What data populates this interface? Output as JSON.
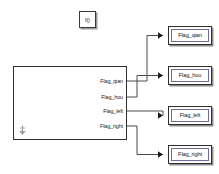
{
  "canvas": {
    "width": 219,
    "height": 174,
    "background": "#ffffff",
    "line_color": "#4a4a4a",
    "border_color": "#2e2e2e",
    "shadow_color": "#8f8f8f",
    "text_color": "#1c1c1c"
  },
  "trigger_block": {
    "label": "f()",
    "name": "function-call-trigger",
    "x": 79,
    "y": 11,
    "width": 17,
    "height": 17
  },
  "main_block": {
    "name": "subsystem-block",
    "x": 13,
    "y": 66,
    "width": 114,
    "height": 74,
    "anchor_icon": "anchor-arrow-icon",
    "ports": [
      {
        "label": "Flag_qian",
        "y": 81
      },
      {
        "label": "Flag_hou",
        "y": 97
      },
      {
        "label": "Flag_left",
        "y": 111
      },
      {
        "label": "Flag_right",
        "y": 126
      }
    ]
  },
  "destination_blocks": [
    {
      "label": "Flag_qian",
      "x": 168,
      "y": 26,
      "width": 44,
      "height": 19
    },
    {
      "label": "Flag_hou",
      "x": 168,
      "y": 66,
      "width": 44,
      "height": 19
    },
    {
      "label": "Flag_left",
      "x": 168,
      "y": 106,
      "width": 44,
      "height": 19
    },
    {
      "label": "Flag_right",
      "x": 168,
      "y": 145,
      "width": 44,
      "height": 19
    }
  ],
  "wires": [
    {
      "name": "wire-flag-qian",
      "path": "M127,81 L147,81 L147,35.5 L163,35.5"
    },
    {
      "name": "wire-flag-hou",
      "path": "M127,97 L137,97 L137,75.5 L163,75.5"
    },
    {
      "name": "wire-flag-left",
      "path": "M127,111 L163,111 L163,115.5"
    },
    {
      "name": "wire-flag-right",
      "path": "M127,126 L137,126 L137,154.5 L163,154.5"
    }
  ],
  "arrowheads": [
    {
      "name": "arrowhead-flag-qian",
      "x": 163,
      "y": 35.5
    },
    {
      "name": "arrowhead-flag-hou",
      "x": 163,
      "y": 75.5
    },
    {
      "name": "arrowhead-flag-left",
      "x": 163,
      "y": 115.5
    },
    {
      "name": "arrowhead-flag-right",
      "x": 163,
      "y": 154.5
    }
  ]
}
